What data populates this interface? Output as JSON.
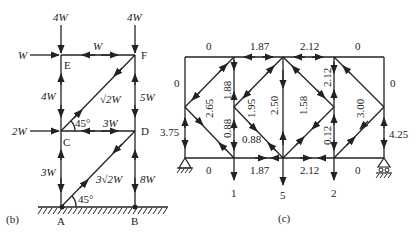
{
  "figure_b": {
    "caption": "(b)",
    "nodes": {
      "E": "E",
      "F": "F",
      "C": "C",
      "D": "D",
      "A": "A",
      "B": "B"
    },
    "loads": {
      "E_down": "4W",
      "F_down": "4W",
      "E_horizontal": "W",
      "C_horizontal": "2W"
    },
    "members": {
      "EF": "W",
      "EC": "4W",
      "FC": "√2W",
      "FD": "5W",
      "CD": "3W",
      "CA": "3W",
      "DA": "3√2W",
      "DB": "8W"
    },
    "angles": {
      "C": "45°",
      "A": "45°"
    }
  },
  "figure_c": {
    "caption": "(c)",
    "top_chord": [
      "0",
      "1.87",
      "2.12",
      "0"
    ],
    "bottom_chord": [
      "0",
      "1.87",
      "2.12",
      "0"
    ],
    "left_vertical_upper": "0",
    "left_vertical_lower": "3.75",
    "right_vertical_upper": "0",
    "right_vertical_lower": "4.25",
    "diagonals": {
      "d1": "2.65",
      "v1_upper": "1.88",
      "v1_lower": "0.88",
      "d2_lower": "0.88",
      "d2_upper": "1.95",
      "v2": "2.50",
      "d3": "1.58",
      "v3_upper": "2.12",
      "v3_lower": "0.12",
      "d4": "3.00"
    },
    "loads": [
      "1",
      "5",
      "2"
    ]
  }
}
